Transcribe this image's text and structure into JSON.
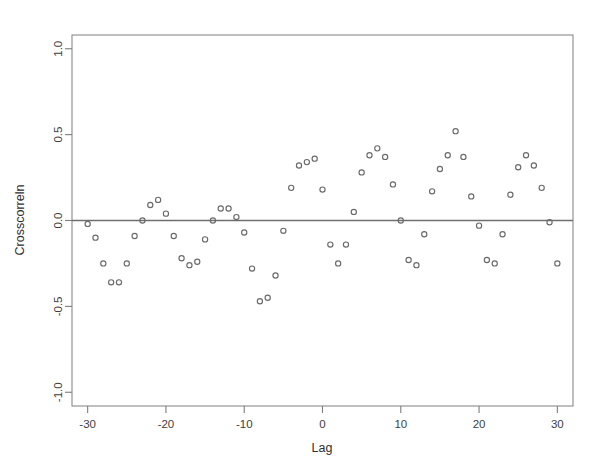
{
  "chart_data": {
    "type": "scatter",
    "title": "",
    "xlabel": "Lag",
    "ylabel": "Crosscorreln",
    "xlim": [
      -32,
      32
    ],
    "ylim": [
      -1.08,
      1.08
    ],
    "xticks": [
      -30,
      -20,
      -10,
      0,
      10,
      20,
      30
    ],
    "xtick_labels": [
      "-30",
      "-20",
      "-10",
      "0",
      "10",
      "20",
      "30"
    ],
    "yticks": [
      -1.0,
      -0.5,
      0.0,
      0.5,
      1.0
    ],
    "ytick_labels": [
      "-1.0",
      "-0.5",
      "0.0",
      "0.5",
      "1.0"
    ],
    "grid": false,
    "legend": false,
    "reference_line_y": 0.0,
    "marker": "open-circle",
    "marker_color": "#6a6a6a",
    "x": [
      -30,
      -29,
      -28,
      -27,
      -26,
      -25,
      -24,
      -23,
      -22,
      -21,
      -20,
      -19,
      -18,
      -17,
      -16,
      -15,
      -14,
      -13,
      -12,
      -11,
      -10,
      -9,
      -8,
      -7,
      -6,
      -5,
      -4,
      -3,
      -2,
      -1,
      0,
      1,
      2,
      3,
      4,
      5,
      6,
      7,
      8,
      9,
      10,
      11,
      12,
      13,
      14,
      15,
      16,
      17,
      18,
      19,
      20,
      21,
      22,
      23,
      24,
      25,
      26,
      27,
      28,
      29,
      30
    ],
    "y": [
      -0.02,
      -0.1,
      -0.25,
      -0.36,
      -0.36,
      -0.25,
      -0.09,
      0.0,
      0.09,
      0.12,
      0.04,
      -0.09,
      -0.22,
      -0.26,
      -0.24,
      -0.11,
      0.0,
      0.07,
      0.07,
      0.02,
      -0.07,
      -0.28,
      -0.47,
      -0.45,
      -0.32,
      -0.06,
      0.19,
      0.32,
      0.34,
      0.36,
      0.18,
      -0.14,
      -0.25,
      -0.14,
      0.05,
      0.28,
      0.38,
      0.42,
      0.37,
      0.21,
      0.0,
      -0.23,
      -0.26,
      -0.08,
      0.17,
      0.3,
      0.38,
      0.52,
      0.37,
      0.14,
      -0.03,
      -0.23,
      -0.25,
      -0.08,
      0.15,
      0.31,
      0.38,
      0.32,
      0.19,
      -0.01,
      -0.25
    ]
  },
  "geometry": {
    "plot_left": 72,
    "plot_right": 573,
    "plot_top": 35,
    "plot_bottom": 406
  }
}
